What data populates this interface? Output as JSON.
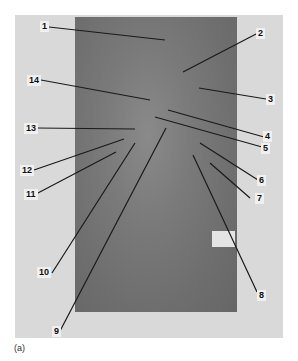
{
  "figure": {
    "caption": "(a)",
    "labels": [
      {
        "id": "1",
        "text": "1"
      },
      {
        "id": "2",
        "text": "2"
      },
      {
        "id": "3",
        "text": "3"
      },
      {
        "id": "4",
        "text": "4"
      },
      {
        "id": "5",
        "text": "5"
      },
      {
        "id": "6",
        "text": "6"
      },
      {
        "id": "7",
        "text": "7"
      },
      {
        "id": "8",
        "text": "8"
      },
      {
        "id": "9",
        "text": "9"
      },
      {
        "id": "10",
        "text": "10"
      },
      {
        "id": "11",
        "text": "11"
      },
      {
        "id": "12",
        "text": "12"
      },
      {
        "id": "13",
        "text": "13"
      },
      {
        "id": "14",
        "text": "14"
      }
    ]
  }
}
